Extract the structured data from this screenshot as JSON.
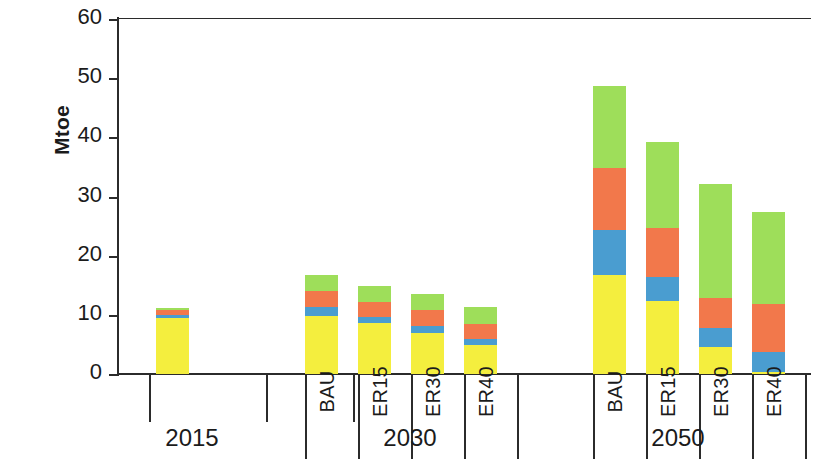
{
  "chart_data": {
    "type": "bar",
    "stacked": true,
    "title": "",
    "subtitle": "",
    "xlabel": "",
    "ylabel": "Mtoe",
    "ylim": [
      0,
      60
    ],
    "yticks": [
      0,
      10,
      20,
      30,
      40,
      50,
      60
    ],
    "grid": false,
    "legend": "none",
    "groups": [
      {
        "label": "2015",
        "categories": [
          "2015"
        ]
      },
      {
        "label": "2030",
        "categories": [
          "BAU",
          "ER15",
          "ER30",
          "ER40"
        ]
      },
      {
        "label": "2050",
        "categories": [
          "BAU",
          "ER15",
          "ER30",
          "ER40"
        ]
      }
    ],
    "categories": [
      "2015",
      "2030 BAU",
      "2030 ER15",
      "2030 ER30",
      "2030 ER40",
      "2050 BAU",
      "2050 ER15",
      "2050 ER30",
      "2050 ER40"
    ],
    "series": [
      {
        "name": "yellow",
        "color": "#f4ee3e",
        "values": [
          9.5,
          9.8,
          8.6,
          7.0,
          4.9,
          16.7,
          12.4,
          4.6,
          0.4
        ]
      },
      {
        "name": "blue",
        "color": "#4a9dd0",
        "values": [
          0.4,
          1.5,
          1.1,
          1.2,
          1.1,
          7.6,
          4.0,
          3.1,
          3.4
        ]
      },
      {
        "name": "orange",
        "color": "#f2784b",
        "values": [
          1.0,
          2.8,
          2.4,
          2.6,
          2.4,
          10.5,
          8.2,
          5.1,
          8.0
        ]
      },
      {
        "name": "green",
        "color": "#9ede5a",
        "values": [
          0.3,
          2.6,
          2.8,
          2.7,
          3.0,
          13.9,
          14.6,
          19.4,
          15.6
        ]
      }
    ],
    "totals": [
      11.2,
      16.7,
      14.9,
      13.5,
      11.4,
      48.7,
      39.2,
      32.2,
      27.4
    ],
    "axis_color": "#2b2b2b",
    "background": "#ffffff"
  }
}
